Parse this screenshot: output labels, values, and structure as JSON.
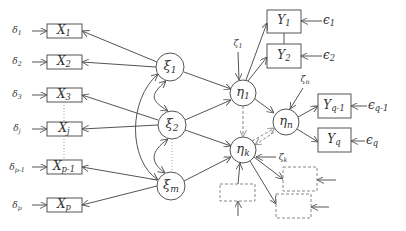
{
  "diagram": {
    "type": "structural-equation-model",
    "colors": {
      "stroke": "#555555",
      "dashed": "#888888",
      "text": "#333333"
    },
    "exogenous_indicators": [
      {
        "name": "X",
        "sub": "1",
        "error": "δ",
        "error_sub": "1"
      },
      {
        "name": "X",
        "sub": "2",
        "error": "δ",
        "error_sub": "2"
      },
      {
        "name": "X",
        "sub": "3",
        "error": "δ",
        "error_sub": "3"
      },
      {
        "name": "X",
        "sub": "j",
        "error": "δ",
        "error_sub": "j"
      },
      {
        "name": "X",
        "sub": "p-1",
        "error": "δ",
        "error_sub": "p-1"
      },
      {
        "name": "X",
        "sub": "p",
        "error": "δ",
        "error_sub": "p"
      }
    ],
    "exogenous_latents": [
      {
        "name": "ξ",
        "sub": "1"
      },
      {
        "name": "ξ",
        "sub": "2"
      },
      {
        "name": "ξ",
        "sub": "m"
      }
    ],
    "endogenous_latents": [
      {
        "name": "η",
        "sub": "1",
        "disturbance": "ζ",
        "disturbance_sub": "1"
      },
      {
        "name": "η",
        "sub": "k",
        "disturbance": "ζ",
        "disturbance_sub": "k"
      },
      {
        "name": "η",
        "sub": "n",
        "disturbance": "ζ",
        "disturbance_sub": "n"
      }
    ],
    "endogenous_indicators": [
      {
        "name": "Y",
        "sub": "1",
        "error": "ϵ",
        "error_sub": "1"
      },
      {
        "name": "Y",
        "sub": "2",
        "error": "ϵ",
        "error_sub": "2"
      },
      {
        "name": "Y",
        "sub": "q-1",
        "error": "ϵ",
        "error_sub": "q-1"
      },
      {
        "name": "Y",
        "sub": "q",
        "error": "ϵ",
        "error_sub": "q"
      }
    ],
    "placeholder_indicators": 3
  }
}
